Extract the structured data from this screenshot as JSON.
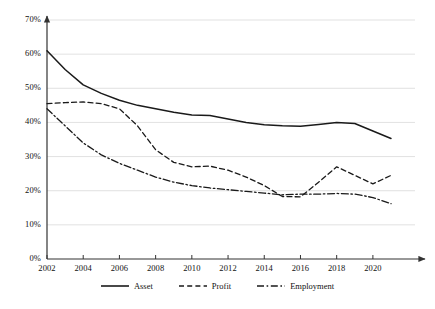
{
  "chart_data": {
    "type": "line",
    "title": "",
    "subtitle": "",
    "xlabel": "",
    "ylabel": "",
    "xlim": [
      2002,
      2021
    ],
    "ylim": [
      0,
      70
    ],
    "grid": true,
    "grid_axis": "y",
    "legend_position": "bottom-center",
    "y_tick_labels": [
      "0%",
      "10%",
      "20%",
      "30%",
      "40%",
      "50%",
      "60%",
      "70%"
    ],
    "y_tick_values": [
      0,
      10,
      20,
      30,
      40,
      50,
      60,
      70
    ],
    "x_tick_labels": [
      "2002",
      "2004",
      "2006",
      "2008",
      "2010",
      "2012",
      "2014",
      "2016",
      "2018",
      "2020"
    ],
    "x_tick_values": [
      2002,
      2004,
      2006,
      2008,
      2010,
      2012,
      2014,
      2016,
      2018,
      2020
    ],
    "x": [
      2002,
      2003,
      2004,
      2005,
      2006,
      2007,
      2008,
      2009,
      2010,
      2011,
      2012,
      2013,
      2014,
      2015,
      2016,
      2017,
      2018,
      2019,
      2020,
      2021
    ],
    "series": [
      {
        "name": "Asset",
        "style": "solid",
        "color": "#1a1a1a",
        "values": [
          61.0,
          55.5,
          51.0,
          48.5,
          46.5,
          45.0,
          44.0,
          43.0,
          42.2,
          42.0,
          41.0,
          40.0,
          39.3,
          39.0,
          38.9,
          39.4,
          40.0,
          39.7,
          37.5,
          35.3
        ]
      },
      {
        "name": "Profit",
        "style": "dashed",
        "color": "#1a1a1a",
        "values": [
          45.5,
          45.8,
          46.0,
          45.5,
          44.0,
          39.0,
          32.0,
          28.3,
          27.0,
          27.2,
          26.0,
          24.0,
          21.5,
          18.3,
          18.2,
          22.5,
          27.0,
          24.5,
          22.0,
          24.5
        ]
      },
      {
        "name": "Employment",
        "style": "dashdot",
        "color": "#1a1a1a",
        "values": [
          44.0,
          39.0,
          34.0,
          30.5,
          28.0,
          26.0,
          24.0,
          22.5,
          21.5,
          20.8,
          20.3,
          19.8,
          19.3,
          18.8,
          19.0,
          19.0,
          19.2,
          19.0,
          18.0,
          16.2
        ]
      }
    ]
  },
  "legend": {
    "items": [
      {
        "label": "Asset",
        "style": "solid"
      },
      {
        "label": "Profit",
        "style": "dashed"
      },
      {
        "label": "Employment",
        "style": "dashdot"
      }
    ]
  },
  "colors": {
    "line": "#1a1a1a",
    "grid": "#d9d9d9",
    "axis": "#333333",
    "background": "#ffffff"
  }
}
